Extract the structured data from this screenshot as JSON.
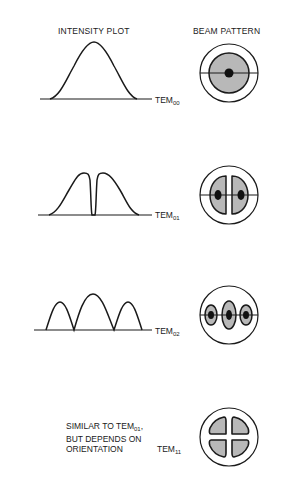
{
  "headers": {
    "intensity": "INTENSITY PLOT",
    "beam": "BEAM PATTERN"
  },
  "modes": [
    {
      "id": "TEM00",
      "prefix": "TEM",
      "subscript": "00",
      "profile": "single gaussian peak",
      "beam": "single central spot"
    },
    {
      "id": "TEM01",
      "prefix": "TEM",
      "subscript": "01",
      "profile": "two peaks with central null",
      "beam": "two lobes"
    },
    {
      "id": "TEM02",
      "prefix": "TEM",
      "subscript": "02",
      "profile": "three peaks, center highest",
      "beam": "three lobes"
    },
    {
      "id": "TEM11",
      "prefix": "TEM",
      "subscript": "11",
      "profile": "none",
      "beam": "four quadrant lobes"
    }
  ],
  "note": {
    "line1_prefix": "SIMILAR TO TEM",
    "line1_sub": "01",
    "line1_suffix": ",",
    "line2": "BUT DEPENDS ON",
    "line3": "ORIENTATION"
  },
  "colors": {
    "stroke": "#1a1a1a",
    "lobe_fill": "#b8b8b8",
    "core_fill": "#111111",
    "background": "#ffffff"
  }
}
